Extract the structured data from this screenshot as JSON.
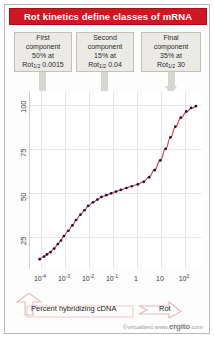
{
  "title": "Rot kinetics define classes of mRNA",
  "colors": {
    "title_bar": "#cf1722",
    "curve": "#d64550",
    "points": "#1b1040",
    "arrow_gray": "#d8d6d2",
    "box_fill": "#eceae6",
    "bottom_arrow_outline": "#e8b9bc"
  },
  "components": [
    {
      "name": "first-component",
      "line1": "First",
      "line2": "component",
      "line3": "50% at",
      "label": "Rot",
      "sub": "1/2",
      "value": "0.0015"
    },
    {
      "name": "second-component",
      "line1": "Second",
      "line2": "component",
      "line3": "15% at",
      "label": "Rot",
      "sub": "1/2",
      "value": "0.04"
    },
    {
      "name": "final-component",
      "line1": "Final",
      "line2": "component",
      "line3": "35% at",
      "label": "Rot",
      "sub": "1/2",
      "value": "30"
    }
  ],
  "bottom": {
    "left_arrow_label": "Percent hybridizing cDNA",
    "right_arrow_label": "Rot"
  },
  "footer": {
    "prefix": "©virtualtext",
    "www": "www.",
    "brand": "ergito",
    "suffix": ".com"
  },
  "chart_data": {
    "type": "scatter",
    "title": "Rot kinetics define classes of mRNA",
    "xlabel": "Rot",
    "ylabel": "Percent hybridizing cDNA",
    "xscale": "log",
    "xlim": [
      -4.7,
      2.4
    ],
    "ylim": [
      8,
      108
    ],
    "grid": true,
    "xticks": [
      {
        "label": "10",
        "exp": "-4",
        "value": -4
      },
      {
        "label": "10",
        "exp": "-3",
        "value": -3
      },
      {
        "label": "10",
        "exp": "-2",
        "value": -2
      },
      {
        "label": "10",
        "exp": "-1",
        "value": -1
      },
      {
        "label": "1",
        "exp": "",
        "value": 0
      },
      {
        "label": "10",
        "exp": "",
        "value": 1
      },
      {
        "label": "10",
        "exp": "2",
        "value": 2
      }
    ],
    "yticks": [
      25,
      50,
      75,
      100
    ],
    "series": [
      {
        "name": "cDNA hybridization",
        "points": [
          [
            -4.3,
            13.5
          ],
          [
            -4.12,
            15.0
          ],
          [
            -4.0,
            16.2
          ],
          [
            -3.85,
            17.5
          ],
          [
            -3.7,
            19.5
          ],
          [
            -3.55,
            22.0
          ],
          [
            -3.42,
            24.0
          ],
          [
            -3.3,
            26.5
          ],
          [
            -3.12,
            29.5
          ],
          [
            -2.95,
            32.5
          ],
          [
            -2.8,
            35.5
          ],
          [
            -2.62,
            38.5
          ],
          [
            -2.45,
            41.0
          ],
          [
            -2.3,
            43.5
          ],
          [
            -2.1,
            45.5
          ],
          [
            -1.92,
            47.0
          ],
          [
            -1.75,
            48.5
          ],
          [
            -1.55,
            49.5
          ],
          [
            -1.35,
            50.5
          ],
          [
            -1.15,
            51.5
          ],
          [
            -0.95,
            52.5
          ],
          [
            -0.72,
            53.5
          ],
          [
            -0.5,
            54.5
          ],
          [
            -0.25,
            55.5
          ],
          [
            0.0,
            57.0
          ],
          [
            0.22,
            59.5
          ],
          [
            0.45,
            63.5
          ],
          [
            0.68,
            69.0
          ],
          [
            0.9,
            75.5
          ],
          [
            1.1,
            82.0
          ],
          [
            1.3,
            88.0
          ],
          [
            1.52,
            93.0
          ],
          [
            1.75,
            96.5
          ],
          [
            1.95,
            98.5
          ],
          [
            2.15,
            99.5
          ]
        ]
      }
    ]
  }
}
